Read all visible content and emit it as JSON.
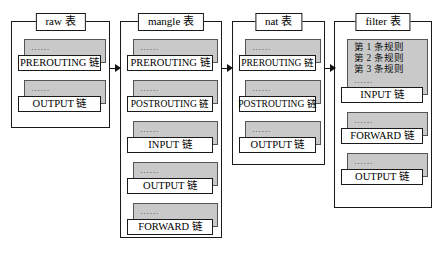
{
  "diagram": {
    "colors": {
      "card_fill": "#c9c9c9",
      "card_border": "#555555",
      "box_border": "#1a1a1a",
      "label_fill": "#ffffff",
      "background": "#ffffff"
    },
    "ellipsis": "……",
    "tables": [
      {
        "id": "raw",
        "title": "raw 表",
        "chains": [
          {
            "name": "PREROUTING 链",
            "dots": "……",
            "rules": []
          },
          {
            "name": "OUTPUT 链",
            "dots": "……",
            "rules": []
          }
        ]
      },
      {
        "id": "mangle",
        "title": "mangle 表",
        "chains": [
          {
            "name": "PREROUTING 链",
            "dots": "……",
            "rules": []
          },
          {
            "name": "POSTROUTING 链",
            "dots": "……",
            "rules": []
          },
          {
            "name": "INPUT 链",
            "dots": "……",
            "rules": []
          },
          {
            "name": "OUTPUT 链",
            "dots": "……",
            "rules": []
          },
          {
            "name": "FORWARD 链",
            "dots": "……",
            "rules": []
          }
        ]
      },
      {
        "id": "nat",
        "title": "nat 表",
        "chains": [
          {
            "name": "PREROUTING 链",
            "dots": "……",
            "rules": []
          },
          {
            "name": "POSTROUTING 链",
            "dots": "……",
            "rules": []
          },
          {
            "name": "OUTPUT 链",
            "dots": "……",
            "rules": []
          }
        ]
      },
      {
        "id": "filter",
        "title": "filter 表",
        "chains": [
          {
            "name": "INPUT 链",
            "dots": "……",
            "rules": [
              "第 1 条规则",
              "第 2 条规则",
              "第 3 条规则"
            ]
          },
          {
            "name": "FORWARD 链",
            "dots": "……",
            "rules": []
          },
          {
            "name": "OUTPUT 链",
            "dots": "……",
            "rules": []
          }
        ]
      }
    ],
    "arrows": [
      {
        "from": "raw",
        "to": "mangle"
      },
      {
        "from": "mangle",
        "to": "nat"
      },
      {
        "from": "nat",
        "to": "filter"
      }
    ]
  }
}
